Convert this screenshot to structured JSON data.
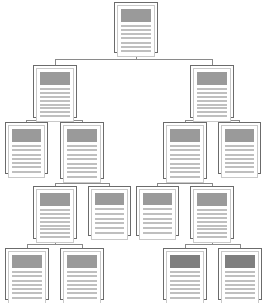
{
  "diagram": {
    "type": "tree",
    "node_count": 13,
    "level_count": 5,
    "orientation": "top-down",
    "background_color": "#ffffff",
    "connector_color": "#8a8a8a",
    "node_border_color": "#6b6b6b",
    "node_inner_border_color": "#c9c9c9",
    "header_color": "#9a9a9a",
    "header_color_dark": "#7f7f7f",
    "line_color": "#bfbfbf",
    "node_icon_name": "document-page-icon",
    "nodes": [
      {
        "id": "n1",
        "label": "root-document",
        "level": 1,
        "x": 114,
        "y": 2,
        "w": 44,
        "h": 51,
        "header_h": 13,
        "lines": 7,
        "header_tone": "normal"
      },
      {
        "id": "n2",
        "label": "left-branch-document",
        "level": 2,
        "x": 33,
        "y": 65,
        "w": 44,
        "h": 53,
        "header_h": 13,
        "lines": 8,
        "header_tone": "normal"
      },
      {
        "id": "n3",
        "label": "right-branch-document",
        "level": 2,
        "x": 190,
        "y": 65,
        "w": 44,
        "h": 53,
        "header_h": 13,
        "lines": 8,
        "header_tone": "normal"
      },
      {
        "id": "n4",
        "label": "left-child-document-a",
        "level": 3,
        "x": 5,
        "y": 122,
        "w": 43,
        "h": 52,
        "header_h": 13,
        "lines": 7,
        "header_tone": "normal"
      },
      {
        "id": "n5",
        "label": "left-child-document-b",
        "level": 3,
        "x": 60,
        "y": 122,
        "w": 44,
        "h": 57,
        "header_h": 13,
        "lines": 8,
        "header_tone": "normal"
      },
      {
        "id": "n6",
        "label": "right-child-document-a",
        "level": 3,
        "x": 163,
        "y": 122,
        "w": 44,
        "h": 57,
        "header_h": 13,
        "lines": 8,
        "header_tone": "normal"
      },
      {
        "id": "n7",
        "label": "right-child-document-b",
        "level": 3,
        "x": 218,
        "y": 122,
        "w": 43,
        "h": 52,
        "header_h": 13,
        "lines": 7,
        "header_tone": "normal"
      },
      {
        "id": "n8",
        "label": "left-grandchild-document-a",
        "level": 4,
        "x": 33,
        "y": 186,
        "w": 44,
        "h": 53,
        "header_h": 13,
        "lines": 8,
        "header_tone": "normal"
      },
      {
        "id": "n9",
        "label": "left-grandchild-document-b",
        "level": 4,
        "x": 88,
        "y": 186,
        "w": 43,
        "h": 50,
        "header_h": 12,
        "lines": 6,
        "header_tone": "normal"
      },
      {
        "id": "n10",
        "label": "right-grandchild-document-a",
        "level": 4,
        "x": 136,
        "y": 186,
        "w": 43,
        "h": 50,
        "header_h": 12,
        "lines": 6,
        "header_tone": "normal"
      },
      {
        "id": "n11",
        "label": "right-grandchild-document-b",
        "level": 4,
        "x": 190,
        "y": 186,
        "w": 44,
        "h": 53,
        "header_h": 13,
        "lines": 8,
        "header_tone": "normal"
      },
      {
        "id": "n12",
        "label": "left-leaf-document-a",
        "level": 5,
        "x": 5,
        "y": 248,
        "w": 44,
        "h": 52,
        "header_h": 13,
        "lines": 7,
        "header_tone": "normal"
      },
      {
        "id": "n13",
        "label": "left-leaf-document-b",
        "level": 5,
        "x": 60,
        "y": 248,
        "w": 44,
        "h": 52,
        "header_h": 13,
        "lines": 7,
        "header_tone": "normal"
      },
      {
        "id": "n14",
        "label": "right-leaf-document-a",
        "level": 5,
        "x": 163,
        "y": 248,
        "w": 44,
        "h": 52,
        "header_h": 13,
        "lines": 7,
        "header_tone": "dark"
      },
      {
        "id": "n15",
        "label": "right-leaf-document-b",
        "level": 5,
        "x": 218,
        "y": 248,
        "w": 44,
        "h": 52,
        "header_h": 13,
        "lines": 7,
        "header_tone": "dark"
      }
    ],
    "edges": [
      {
        "from": "n1",
        "to": "n2",
        "label": "root-to-left-branch"
      },
      {
        "from": "n1",
        "to": "n3",
        "label": "root-to-right-branch"
      },
      {
        "from": "n2",
        "to": "n4",
        "label": "left-branch-to-child-a"
      },
      {
        "from": "n2",
        "to": "n5",
        "label": "left-branch-to-child-b"
      },
      {
        "from": "n3",
        "to": "n6",
        "label": "right-branch-to-child-a"
      },
      {
        "from": "n3",
        "to": "n7",
        "label": "right-branch-to-child-b"
      },
      {
        "from": "n5",
        "to": "n8",
        "label": "left-child-b-to-grandchild-a"
      },
      {
        "from": "n5",
        "to": "n9",
        "label": "left-child-b-to-grandchild-b"
      },
      {
        "from": "n6",
        "to": "n10",
        "label": "right-child-a-to-grandchild-a"
      },
      {
        "from": "n6",
        "to": "n11",
        "label": "right-child-a-to-grandchild-b"
      },
      {
        "from": "n8",
        "to": "n12",
        "label": "left-grandchild-a-to-leaf-a"
      },
      {
        "from": "n8",
        "to": "n13",
        "label": "left-grandchild-a-to-leaf-b"
      },
      {
        "from": "n11",
        "to": "n14",
        "label": "right-grandchild-b-to-leaf-a"
      },
      {
        "from": "n11",
        "to": "n15",
        "label": "right-grandchild-b-to-leaf-b"
      }
    ]
  }
}
